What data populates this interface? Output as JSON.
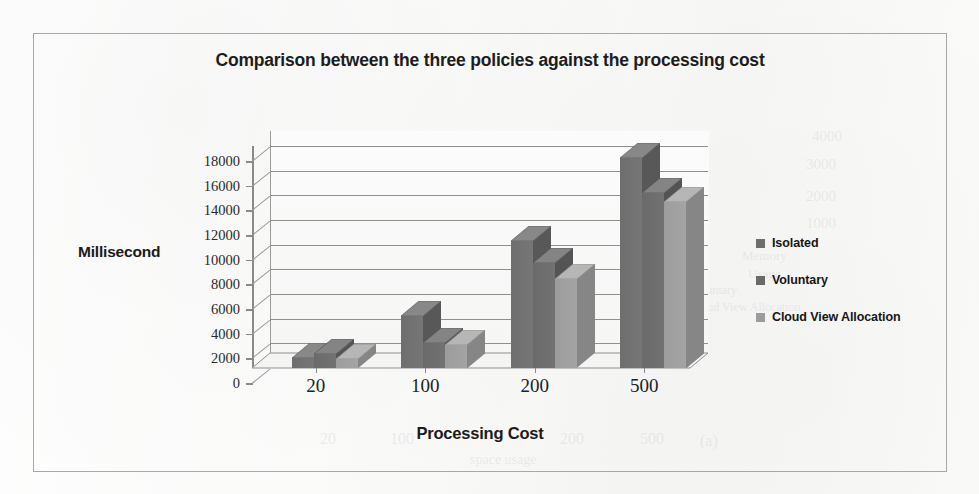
{
  "figure": {
    "title": "Comparison between the three policies against the processing cost",
    "border_color": "#a8a8a8",
    "background": "#fbfbfa"
  },
  "axis_titles": {
    "y": "Millisecond",
    "x": "Processing Cost"
  },
  "legend": {
    "position": "right",
    "entries": [
      {
        "label": "Isolated",
        "color": "#6e6e6e"
      },
      {
        "label": "Voluntary",
        "color": "#6a6a6a"
      },
      {
        "label": "Cloud View Allocation",
        "color": "#9c9c9c"
      }
    ]
  },
  "chart_data": {
    "type": "bar",
    "title": "Comparison between the three policies against the processing cost",
    "subtitle": "",
    "xlabel": "Processing Cost",
    "ylabel": "Millisecond",
    "categories": [
      "20",
      "100",
      "200",
      "500"
    ],
    "series": [
      {
        "name": "Isolated",
        "color": "#6e6e6e",
        "values": [
          850,
          4200,
          10300,
          17000
        ]
      },
      {
        "name": "Voluntary",
        "color": "#6a6a6a",
        "values": [
          1150,
          2000,
          8500,
          14200
        ]
      },
      {
        "name": "Cloud View Allocation",
        "color": "#9c9c9c",
        "values": [
          750,
          1900,
          7200,
          13500
        ]
      }
    ],
    "ylim": [
      0,
      18000
    ],
    "ytick_step": 2000,
    "yticks": [
      18000,
      16000,
      14000,
      12000,
      10000,
      8000,
      6000,
      4000,
      2000,
      0
    ],
    "ytick_labels": [
      "18000",
      "16000",
      "14000",
      "12000",
      "10000",
      "8000",
      "6000",
      "4000",
      "2000",
      "0"
    ],
    "grid": true,
    "grid_axis": "y",
    "legend_position": "right",
    "three_d": true
  },
  "ghost_text": {
    "items": [
      {
        "text": "4000",
        "x": 812,
        "y": 128,
        "size": 15
      },
      {
        "text": "3000",
        "x": 806,
        "y": 156,
        "size": 15
      },
      {
        "text": "2000",
        "x": 806,
        "y": 188,
        "size": 15
      },
      {
        "text": "1000",
        "x": 806,
        "y": 215,
        "size": 15
      },
      {
        "text": "Memory",
        "x": 742,
        "y": 248,
        "size": 13
      },
      {
        "text": "Usage",
        "x": 748,
        "y": 266,
        "size": 13
      },
      {
        "text": "Cloud View Allocation",
        "x": 690,
        "y": 300,
        "size": 12
      },
      {
        "text": "Voluntary",
        "x": 690,
        "y": 283,
        "size": 12
      },
      {
        "text": "500",
        "x": 640,
        "y": 430,
        "size": 16
      },
      {
        "text": "200",
        "x": 560,
        "y": 430,
        "size": 16
      },
      {
        "text": "(a)",
        "x": 700,
        "y": 432,
        "size": 16
      },
      {
        "text": "space usage",
        "x": 470,
        "y": 452,
        "size": 14
      },
      {
        "text": "100",
        "x": 390,
        "y": 430,
        "size": 16
      },
      {
        "text": "20",
        "x": 320,
        "y": 430,
        "size": 16
      },
      {
        "text": "policies",
        "x": 420,
        "y": 210,
        "size": 14
      },
      {
        "text": "three",
        "x": 330,
        "y": 225,
        "size": 14
      }
    ]
  }
}
